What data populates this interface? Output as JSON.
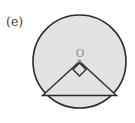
{
  "figure": {
    "panel_label": "(e)",
    "background_color": "#ffffff",
    "width": 135,
    "height": 123
  },
  "circle": {
    "name": "circle",
    "center_x": 79.5,
    "center_y": 61.5,
    "radius": 46.5,
    "fill_color": "#e2e2e2",
    "stroke_color": "#2b2b2b",
    "stroke_width": 1.6
  },
  "center_point": {
    "label": "O",
    "label_color": "#8c8c8c",
    "label_x": 80,
    "label_y": 57,
    "dot_x": 79.5,
    "dot_y": 61.5,
    "dot_radius": 2.0,
    "dot_color": "#8c8c8c"
  },
  "triangle": {
    "name": "inscribed-triangle",
    "apex_x": 79.5,
    "apex_y": 61.5,
    "left_x": 42.5,
    "left_y": 95.5,
    "right_x": 116.5,
    "right_y": 95.5,
    "fill_color": "#e2e2e2",
    "stroke_color": "#2b2b2b",
    "stroke_width": 1.4,
    "points": "79.5,61.5 42.5,95.5 116.5,95.5"
  },
  "right_angle_marker": {
    "name": "right-angle-marker",
    "description": "diamond marking the 90 degree central angle at O",
    "points": "79.5,63.0 86.0,69.5 79.5,76.0 73.0,69.5",
    "stroke_color": "#2b2b2b",
    "stroke_width": 1.3,
    "fill_color": "none"
  }
}
